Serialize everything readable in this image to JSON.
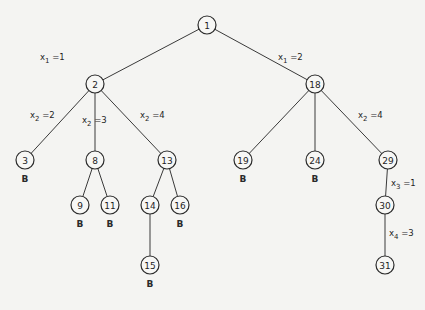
{
  "diagram": {
    "type": "state-space-tree",
    "node_radius": 9,
    "nodes": [
      {
        "id": "1",
        "label": "1",
        "x": 207,
        "y": 25,
        "bounded": false
      },
      {
        "id": "2",
        "label": "2",
        "x": 95,
        "y": 84,
        "bounded": false
      },
      {
        "id": "18",
        "label": "18",
        "x": 315,
        "y": 84,
        "bounded": false
      },
      {
        "id": "3",
        "label": "3",
        "x": 25,
        "y": 160,
        "bounded": true
      },
      {
        "id": "8",
        "label": "8",
        "x": 95,
        "y": 160,
        "bounded": false
      },
      {
        "id": "13",
        "label": "13",
        "x": 167,
        "y": 160,
        "bounded": false
      },
      {
        "id": "19",
        "label": "19",
        "x": 243,
        "y": 160,
        "bounded": true
      },
      {
        "id": "24",
        "label": "24",
        "x": 315,
        "y": 160,
        "bounded": true
      },
      {
        "id": "29",
        "label": "29",
        "x": 388,
        "y": 160,
        "bounded": false
      },
      {
        "id": "9",
        "label": "9",
        "x": 80,
        "y": 205,
        "bounded": true
      },
      {
        "id": "11",
        "label": "11",
        "x": 110,
        "y": 205,
        "bounded": true
      },
      {
        "id": "14",
        "label": "14",
        "x": 150,
        "y": 205,
        "bounded": false
      },
      {
        "id": "16",
        "label": "16",
        "x": 180,
        "y": 205,
        "bounded": true
      },
      {
        "id": "30",
        "label": "30",
        "x": 385,
        "y": 205,
        "bounded": false
      },
      {
        "id": "15",
        "label": "15",
        "x": 150,
        "y": 265,
        "bounded": true
      },
      {
        "id": "31",
        "label": "31",
        "x": 385,
        "y": 265,
        "bounded": false
      }
    ],
    "edges": [
      {
        "from": "1",
        "to": "2",
        "var": "x",
        "sub": "1",
        "val": "1",
        "lx": 40,
        "ly": 60
      },
      {
        "from": "1",
        "to": "18",
        "var": "x",
        "sub": "1",
        "val": "2",
        "lx": 278,
        "ly": 60
      },
      {
        "from": "2",
        "to": "3",
        "var": "x",
        "sub": "2",
        "val": "2",
        "lx": 30,
        "ly": 118
      },
      {
        "from": "2",
        "to": "8",
        "var": "x",
        "sub": "2",
        "val": "3",
        "lx": 82,
        "ly": 123
      },
      {
        "from": "2",
        "to": "13",
        "var": "x",
        "sub": "2",
        "val": "4",
        "lx": 140,
        "ly": 118
      },
      {
        "from": "18",
        "to": "19"
      },
      {
        "from": "18",
        "to": "24"
      },
      {
        "from": "18",
        "to": "29",
        "var": "x",
        "sub": "2",
        "val": "4",
        "lx": 358,
        "ly": 118
      },
      {
        "from": "8",
        "to": "9"
      },
      {
        "from": "8",
        "to": "11"
      },
      {
        "from": "13",
        "to": "14"
      },
      {
        "from": "13",
        "to": "16"
      },
      {
        "from": "14",
        "to": "15"
      },
      {
        "from": "29",
        "to": "30",
        "var": "x",
        "sub": "3",
        "val": "1",
        "lx": 391,
        "ly": 186
      },
      {
        "from": "30",
        "to": "31",
        "var": "x",
        "sub": "4",
        "val": "3",
        "lx": 389,
        "ly": 236
      }
    ],
    "bound_marker": "B"
  }
}
